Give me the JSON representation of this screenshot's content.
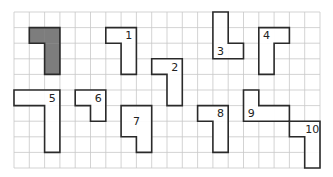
{
  "puzzle": {
    "grid": {
      "cols": 20,
      "rows": 10,
      "origin_x": 14,
      "origin_y": 12,
      "cell_w": 15.3,
      "cell_h": 15.6
    },
    "colors": {
      "grid": "#c8c8c8",
      "outline": "#2a2a2a",
      "shaded_fill": "#7d7d7d",
      "fill": "#ffffff"
    },
    "pieces": [
      {
        "id": "shaded",
        "label": "",
        "shaded": true,
        "cells": [
          [
            1,
            1
          ],
          [
            2,
            1
          ],
          [
            2,
            2
          ],
          [
            2,
            3
          ]
        ],
        "label_cell": null
      },
      {
        "id": "1",
        "label": "1",
        "shaded": false,
        "cells": [
          [
            6,
            1
          ],
          [
            7,
            1
          ],
          [
            7,
            2
          ],
          [
            7,
            3
          ]
        ],
        "label_cell": [
          7,
          1
        ]
      },
      {
        "id": "2",
        "label": "2",
        "shaded": false,
        "cells": [
          [
            9,
            3
          ],
          [
            10,
            3
          ],
          [
            10,
            4
          ],
          [
            10,
            5
          ]
        ],
        "label_cell": [
          10,
          3
        ]
      },
      {
        "id": "3",
        "label": "3",
        "shaded": false,
        "cells": [
          [
            13,
            0
          ],
          [
            13,
            1
          ],
          [
            13,
            2
          ],
          [
            14,
            2
          ]
        ],
        "label_cell": [
          13,
          2
        ]
      },
      {
        "id": "4",
        "label": "4",
        "shaded": false,
        "cells": [
          [
            16,
            1
          ],
          [
            17,
            1
          ],
          [
            16,
            2
          ],
          [
            16,
            3
          ]
        ],
        "label_cell": [
          16,
          1
        ]
      },
      {
        "id": "5",
        "label": "5",
        "shaded": false,
        "cells": [
          [
            0,
            5
          ],
          [
            1,
            5
          ],
          [
            2,
            5
          ],
          [
            2,
            6
          ],
          [
            2,
            7
          ],
          [
            2,
            8
          ]
        ],
        "label_cell": [
          2,
          5
        ]
      },
      {
        "id": "6",
        "label": "6",
        "shaded": false,
        "cells": [
          [
            4,
            5
          ],
          [
            5,
            5
          ],
          [
            5,
            6
          ]
        ],
        "label_cell": [
          5,
          5
        ]
      },
      {
        "id": "7",
        "label": "7",
        "shaded": false,
        "cells": [
          [
            7,
            6
          ],
          [
            8,
            6
          ],
          [
            7,
            7
          ],
          [
            8,
            7
          ],
          [
            8,
            8
          ]
        ],
        "label_cell": [
          7.5,
          6.5
        ]
      },
      {
        "id": "8",
        "label": "8",
        "shaded": false,
        "cells": [
          [
            12,
            6
          ],
          [
            13,
            6
          ],
          [
            13,
            7
          ],
          [
            13,
            8
          ]
        ],
        "label_cell": [
          13,
          6
        ]
      },
      {
        "id": "9",
        "label": "9",
        "shaded": false,
        "cells": [
          [
            15,
            5
          ],
          [
            15,
            6
          ],
          [
            16,
            6
          ],
          [
            17,
            6
          ]
        ],
        "label_cell": [
          15,
          6
        ]
      },
      {
        "id": "10",
        "label": "10",
        "shaded": false,
        "cells": [
          [
            18,
            7
          ],
          [
            19,
            7
          ],
          [
            19,
            8
          ],
          [
            19,
            9
          ]
        ],
        "label_cell": [
          19,
          7
        ]
      }
    ]
  }
}
